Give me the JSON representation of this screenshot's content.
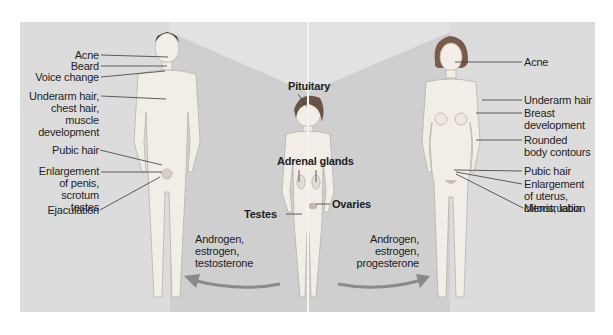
{
  "male": {
    "labels": [
      {
        "id": "acne",
        "text": "Acne"
      },
      {
        "id": "beard",
        "text": "Beard"
      },
      {
        "id": "voice",
        "text": "Voice change"
      },
      {
        "id": "underarm",
        "text": "Underarm hair,\nchest hair,\nmuscle\ndevelopment"
      },
      {
        "id": "pubic",
        "text": "Pubic hair"
      },
      {
        "id": "enlargement",
        "text": "Enlargement\nof penis,\nscrotum\ntestes"
      },
      {
        "id": "ejaculation",
        "text": "Ejaculation"
      }
    ],
    "hormones": "Androgen,\nestrogen,\ntestosterone"
  },
  "child": {
    "labels": [
      {
        "id": "pituitary",
        "text": "Pituitary"
      },
      {
        "id": "adrenal",
        "text": "Adrenal glands"
      },
      {
        "id": "ovaries",
        "text": "Ovaries"
      },
      {
        "id": "testes",
        "text": "Testes"
      }
    ]
  },
  "female": {
    "labels": [
      {
        "id": "acne",
        "text": "Acne"
      },
      {
        "id": "underarm",
        "text": "Underarm hair"
      },
      {
        "id": "breast",
        "text": "Breast\ndevelopment"
      },
      {
        "id": "contours",
        "text": "Rounded\nbody contours"
      },
      {
        "id": "pubic",
        "text": "Pubic hair"
      },
      {
        "id": "enlargement",
        "text": "Enlargement\nof uterus,\nclitoris, labia"
      },
      {
        "id": "menstruation",
        "text": "Menstruation"
      }
    ],
    "hormones": "Androgen,\nestrogen,\nprogesterone"
  },
  "colors": {
    "panel": "#dcdcdc",
    "wedge": "#c9c9c9",
    "arrow": "#8a8a8a",
    "skin": "#f1ece6",
    "leader": "#3a3a3a"
  }
}
